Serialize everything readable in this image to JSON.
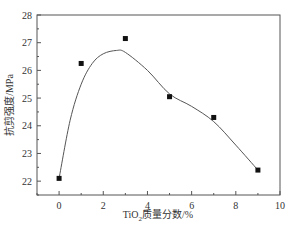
{
  "chart_data": {
    "type": "scatter",
    "title": "",
    "xlabel": "TiO2质量分数/%",
    "xlabel_parts": {
      "prefix": "TiO",
      "subscript": "2",
      "suffix": "质量分数/%"
    },
    "ylabel": "抗剪强度/MPa",
    "xlim": [
      -1,
      10
    ],
    "ylim": [
      21.5,
      28
    ],
    "xticks": [
      0,
      2,
      4,
      6,
      8,
      10
    ],
    "yticks": [
      22,
      23,
      24,
      25,
      26,
      27,
      28
    ],
    "grid": false,
    "legend": null,
    "series": [
      {
        "name": "measured",
        "marker": "square",
        "color": "#111111",
        "x": [
          0,
          1,
          3,
          5,
          7,
          9
        ],
        "y": [
          22.1,
          26.25,
          27.15,
          25.05,
          24.3,
          22.4
        ]
      },
      {
        "name": "fitted curve",
        "style": "line",
        "color": "#555555",
        "x": [
          0,
          0.5,
          1,
          1.5,
          2,
          2.6,
          3,
          4,
          5,
          6,
          7,
          8,
          9
        ],
        "y": [
          22.1,
          24.2,
          25.5,
          26.25,
          26.6,
          26.72,
          26.65,
          26.0,
          25.15,
          24.7,
          24.15,
          23.3,
          22.4
        ]
      }
    ]
  }
}
